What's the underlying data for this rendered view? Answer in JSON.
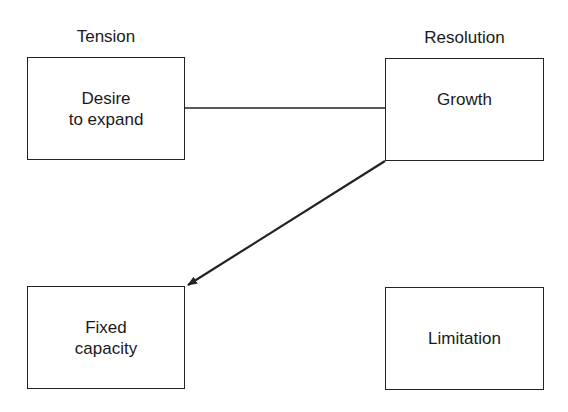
{
  "diagram": {
    "columns": {
      "left_heading": "Tension",
      "right_heading": "Resolution"
    },
    "nodes": [
      {
        "id": "desire",
        "label": "Desire\nto expand"
      },
      {
        "id": "growth",
        "label": "Growth"
      },
      {
        "id": "fixed",
        "label": "Fixed\ncapacity"
      },
      {
        "id": "limitation",
        "label": "Limitation"
      }
    ],
    "edges": [
      {
        "from": "desire",
        "to": "growth",
        "type": "line"
      },
      {
        "from": "growth",
        "to": "fixed",
        "type": "arrow"
      }
    ],
    "colors": {
      "stroke": "#222222",
      "background": "#ffffff"
    }
  }
}
